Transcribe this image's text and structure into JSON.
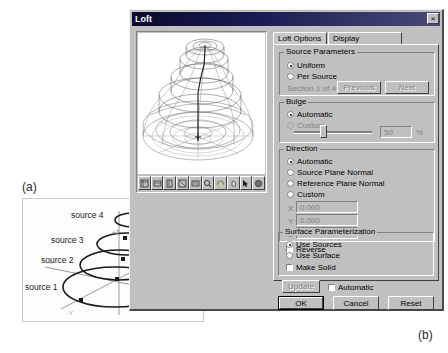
{
  "figure": {
    "label_a": "(a)",
    "label_b": "(b)"
  },
  "diagram_a": {
    "sources": [
      {
        "label": "source 1"
      },
      {
        "label": "source 2"
      },
      {
        "label": "source 3"
      },
      {
        "label": "source 4"
      }
    ],
    "axes": [
      {
        "label": "+X"
      },
      {
        "label": "+Y"
      },
      {
        "label": "+Z"
      },
      {
        "label": "-Y"
      },
      {
        "label": "-Z"
      }
    ]
  },
  "dialog": {
    "title": "Loft",
    "close_label": "×",
    "tabs": [
      {
        "label": "Loft Options",
        "active": true
      },
      {
        "label": "Display Resolution",
        "active": false
      }
    ],
    "viewport": {
      "toolbar_icons": [
        "iso-view-icon",
        "front-view-icon",
        "side-view-icon",
        "top-view-icon",
        "fit-view-icon",
        "zoom-icon",
        "rotate-icon",
        "pan-icon",
        "select-arrow-icon",
        "orbit-icon"
      ]
    },
    "source_parameters": {
      "title": "Source Parameters",
      "uniform_label": "Uniform",
      "per_source_label": "Per Source",
      "section_text": "Section 1 of 4",
      "previous_label": "Previous",
      "next_label": "Next"
    },
    "bulge": {
      "title": "Bulge",
      "automatic_label": "Automatic",
      "custom_label": "Custom",
      "value": "50",
      "percent_label": "%"
    },
    "direction": {
      "title": "Direction",
      "automatic_label": "Automatic",
      "source_plane_label": "Source Plane Normal",
      "reference_plane_label": "Reference Plane Normal",
      "custom_label": "Custom",
      "x_label": "X",
      "x_value": "0.000",
      "y_label": "Y",
      "y_value": "0.000",
      "z_label": "Z",
      "z_value": "1.000",
      "reverse_label": "Reverse"
    },
    "surface_parameterization": {
      "title": "Surface Parameterization",
      "use_sources_label": "Use Sources",
      "use_surface_label": "Use Surface",
      "make_solid_label": "Make Solid"
    },
    "update": {
      "update_label": "Update",
      "automatic_label": "Automatic"
    },
    "footer": {
      "ok_label": "OK",
      "cancel_label": "Cancel",
      "reset_label": "Reset"
    }
  }
}
